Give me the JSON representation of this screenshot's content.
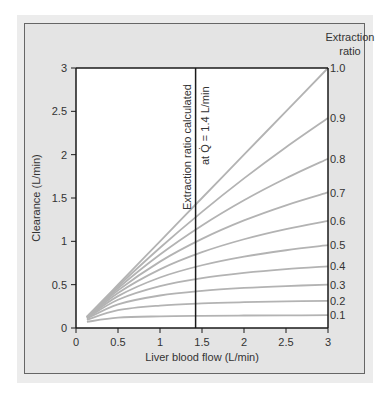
{
  "chart_data": {
    "type": "line",
    "title": "",
    "xlabel": "Liver blood flow (L/min)",
    "ylabel": "Clearance (L/min)",
    "xlim": [
      0,
      3
    ],
    "ylim": [
      0,
      3
    ],
    "grid": false,
    "x_ticks": [
      "0",
      "0.5",
      "1",
      "1.5",
      "2",
      "2.5",
      "3"
    ],
    "y_ticks": [
      "0",
      "0.5",
      "1",
      "1.5",
      "2",
      "2.5",
      "3"
    ],
    "legend_title_line1": "Extraction",
    "legend_title_line2": "ratio",
    "annotation": {
      "line1": "Extraction ratio calculated",
      "line2": "at Q̇ = 1.4 L/min",
      "x": 1.4
    },
    "x": [
      0.13,
      0.5,
      1.0,
      1.5,
      2.0,
      2.5,
      3.0
    ],
    "series": [
      {
        "name": "0.1",
        "values": [
          0.071,
          0.119,
          0.135,
          0.141,
          0.144,
          0.146,
          0.148
        ]
      },
      {
        "name": "0.2",
        "values": [
          0.095,
          0.206,
          0.259,
          0.284,
          0.298,
          0.307,
          0.313
        ]
      },
      {
        "name": "0.3",
        "values": [
          0.107,
          0.273,
          0.375,
          0.429,
          0.462,
          0.484,
          0.5
        ]
      },
      {
        "name": "0.4",
        "values": [
          0.114,
          0.326,
          0.483,
          0.575,
          0.636,
          0.68,
          0.712
        ]
      },
      {
        "name": "0.5",
        "values": [
          0.119,
          0.368,
          0.583,
          0.724,
          0.824,
          0.897,
          0.955
        ]
      },
      {
        "name": "0.6",
        "values": [
          0.122,
          0.404,
          0.677,
          0.875,
          1.024,
          1.141,
          1.235
        ]
      },
      {
        "name": "0.7",
        "values": [
          0.125,
          0.434,
          0.766,
          1.028,
          1.241,
          1.416,
          1.564
        ]
      },
      {
        "name": "0.8",
        "values": [
          0.127,
          0.459,
          0.848,
          1.183,
          1.474,
          1.728,
          1.953
        ]
      },
      {
        "name": "0.9",
        "values": [
          0.129,
          0.481,
          0.926,
          1.34,
          1.726,
          2.086,
          2.423
        ]
      },
      {
        "name": "1.0",
        "values": [
          0.13,
          0.5,
          1.0,
          1.5,
          2.0,
          2.5,
          3.0
        ]
      }
    ],
    "colors": {
      "curve": "#b3b3b3",
      "axis": "#1a1a1a",
      "panel": "#e6e6e6",
      "panel_border": "#555555",
      "plot_bg": "#ffffff"
    }
  }
}
